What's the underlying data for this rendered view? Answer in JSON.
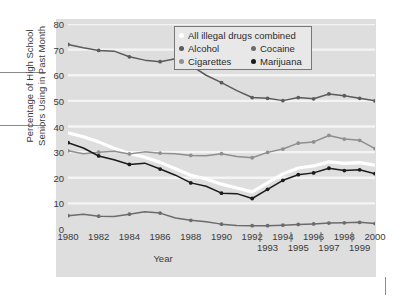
{
  "chart_data": {
    "type": "line",
    "title": "",
    "xlabel": "Year",
    "ylabel": "Percentage of High School Seniors Using in Past Month",
    "ylabel_line1": "Percentage of High School",
    "ylabel_line2": "Seniors Using in Past Month",
    "ylim": [
      0,
      80
    ],
    "yticks": [
      0,
      10,
      20,
      30,
      40,
      50,
      60,
      70,
      80
    ],
    "grid": "horizontal-only",
    "legend_position": "top-center-inside",
    "x": [
      1980,
      1981,
      1982,
      1983,
      1984,
      1985,
      1986,
      1987,
      1988,
      1989,
      1990,
      1991,
      1992,
      1993,
      1994,
      1995,
      1996,
      1997,
      1998,
      1999,
      2000
    ],
    "xtick_labels_row0": [
      "1980",
      "1982",
      "1984",
      "1986",
      "1988",
      "1990",
      "1992",
      "1994",
      "1996",
      "1998",
      "2000"
    ],
    "xtick_labels_row1": [
      "1993",
      "1995",
      "1997",
      "1999"
    ],
    "xtick_separators": [
      1992.5,
      1994.5,
      1996.5,
      1998.5
    ],
    "series": [
      {
        "name": "All illegal drugs combined",
        "color": "#ffffff",
        "marker": "none",
        "values": [
          37.5,
          36.0,
          34.0,
          31.5,
          29.5,
          28.0,
          26.0,
          23.5,
          21.0,
          19.5,
          17.5,
          16.0,
          14.5,
          18.0,
          21.5,
          23.8,
          24.6,
          26.2,
          25.6,
          25.9,
          24.9
        ]
      },
      {
        "name": "Alcohol",
        "color": "#5b5b5b",
        "marker": "dot",
        "values": [
          72.0,
          70.7,
          69.7,
          69.4,
          67.2,
          65.9,
          65.3,
          66.4,
          63.9,
          60.0,
          57.1,
          54.0,
          51.3,
          51.0,
          50.1,
          51.3,
          50.8,
          52.7,
          52.0,
          51.0,
          50.0
        ]
      },
      {
        "name": "Cigarettes",
        "color": "#8f8f8f",
        "marker": "dot",
        "values": [
          30.5,
          29.4,
          30.0,
          30.3,
          29.3,
          30.1,
          29.6,
          29.4,
          28.7,
          28.6,
          29.4,
          28.3,
          27.8,
          29.9,
          31.2,
          33.5,
          34.0,
          36.5,
          35.1,
          34.6,
          31.4
        ]
      },
      {
        "name": "Cocaine",
        "color": "#6b6b6b",
        "marker": "dot",
        "values": [
          5.2,
          5.8,
          5.0,
          4.9,
          5.8,
          6.7,
          6.2,
          4.3,
          3.4,
          2.8,
          1.9,
          1.4,
          1.3,
          1.3,
          1.5,
          1.8,
          2.0,
          2.3,
          2.4,
          2.6,
          2.1
        ]
      },
      {
        "name": "Marijuana",
        "color": "#1b1b1b",
        "marker": "dot",
        "values": [
          33.7,
          31.6,
          28.5,
          27.0,
          25.2,
          25.7,
          23.4,
          21.0,
          18.0,
          16.7,
          14.0,
          13.8,
          11.9,
          15.5,
          19.0,
          21.2,
          21.9,
          23.7,
          22.8,
          23.1,
          21.6
        ]
      }
    ]
  },
  "legend": {
    "rows": [
      [
        {
          "label": "All illegal drugs combined",
          "color": "#ffffff"
        }
      ],
      [
        {
          "label": "Alcohol",
          "color": "#5b5b5b"
        },
        {
          "label": "Cocaine",
          "color": "#6b6b6b"
        }
      ],
      [
        {
          "label": "Cigarettes",
          "color": "#8f8f8f"
        },
        {
          "label": "Marijuana",
          "color": "#1b1b1b"
        }
      ]
    ]
  },
  "colors": {
    "panel_background": "#dedede",
    "page_background": "#ffffff",
    "gridline": "#f4f4f4",
    "text": "#3a3a3a"
  }
}
